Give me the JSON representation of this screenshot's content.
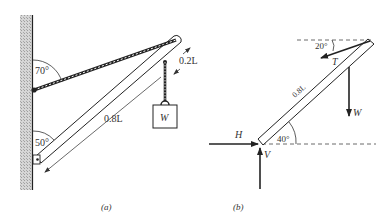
{
  "figure": {
    "panel_a": {
      "caption": "(a)",
      "angle_cable_wall": "70°",
      "angle_beam_wall": "50°",
      "dimension_short": "0.2L",
      "dimension_long": "0.8L",
      "weight_label": "W"
    },
    "panel_b": {
      "caption": "(b)",
      "angle_tension": "20°",
      "angle_beam": "40°",
      "beam_length": "0.8L",
      "forces": {
        "tension": "T",
        "weight": "W",
        "horizontal_reaction": "H",
        "vertical_reaction": "V"
      }
    }
  },
  "colors": {
    "ink": "#222222",
    "wall_hatch": "#bdbdbd",
    "background": "#ffffff"
  }
}
